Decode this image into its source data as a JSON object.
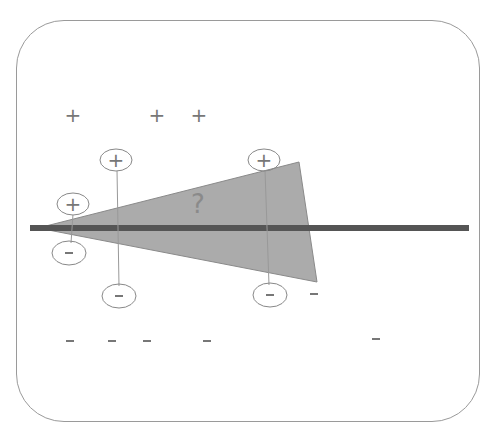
{
  "diagram": {
    "question_label": "?",
    "plus_symbol": "+",
    "minus_symbol": "-",
    "colors": {
      "frame_border": "#9a9a9a",
      "wedge_fill": "#ababab",
      "boundary_bar": "#555555",
      "symbols": "#777777"
    },
    "free_plus": [
      {
        "x": 73,
        "y": 115
      },
      {
        "x": 157,
        "y": 115
      },
      {
        "x": 199,
        "y": 115
      }
    ],
    "free_minus": [
      {
        "x": 70,
        "y": 341
      },
      {
        "x": 112,
        "y": 341
      },
      {
        "x": 147,
        "y": 341
      },
      {
        "x": 207,
        "y": 341
      },
      {
        "x": 376,
        "y": 339
      },
      {
        "x": 314,
        "y": 294
      }
    ],
    "circled_pairs": [
      {
        "plus": {
          "x": 73,
          "y": 204
        },
        "minus": {
          "x": 69,
          "y": 253
        }
      },
      {
        "plus": {
          "x": 116,
          "y": 160
        },
        "minus": {
          "x": 119,
          "y": 296
        }
      },
      {
        "plus": {
          "x": 264,
          "y": 160
        },
        "minus": {
          "x": 270,
          "y": 295
        }
      }
    ]
  }
}
